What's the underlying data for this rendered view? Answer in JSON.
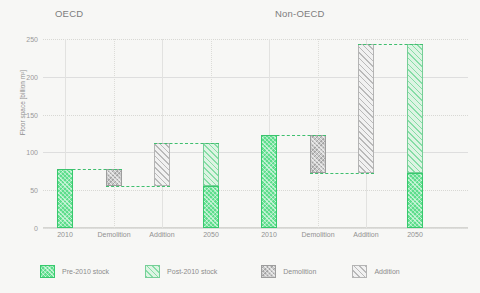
{
  "panels": {
    "left_title": "OECD",
    "right_title": "Non-OECD"
  },
  "axis": {
    "ylabel": "Floor space [billion m²]",
    "yticks": [
      "250",
      "200",
      "150",
      "100",
      "50",
      "0"
    ],
    "xticks_oecd": [
      "2010",
      "Demolition",
      "Addition",
      "2050"
    ],
    "xticks_nonoecd": [
      "2010",
      "Demolition",
      "Addition",
      "2050"
    ]
  },
  "legend": [
    {
      "label": "Pre-2010 stock",
      "color": "#5ddd8c",
      "style": "pre"
    },
    {
      "label": "Post-2010 stock",
      "color": "#ddf4e3",
      "style": "post"
    },
    {
      "label": "Demolition",
      "color": "#c9c9c9",
      "style": "demo"
    },
    {
      "label": "Addition",
      "color": "#f1f1f1",
      "style": "add"
    }
  ],
  "chart_data": {
    "type": "bar",
    "subtype": "waterfall",
    "title": "",
    "xlabel": "",
    "ylabel": "Floor space [billion m²]",
    "ylim": [
      0,
      250
    ],
    "ytick_values": [
      0,
      50,
      100,
      150,
      200,
      250
    ],
    "grid": true,
    "legend_position": "bottom",
    "panels": [
      {
        "name": "OECD",
        "categories": [
          "2010",
          "Demolition",
          "Addition",
          "2050"
        ],
        "bars": [
          {
            "category": "2010",
            "type": "total",
            "base": 0,
            "top": 78,
            "value": 78,
            "segments": [
              {
                "style": "pre",
                "from": 0,
                "to": 78
              }
            ]
          },
          {
            "category": "Demolition",
            "type": "decrease",
            "base": 56,
            "top": 78,
            "value": -22,
            "segments": [
              {
                "style": "demo",
                "from": 56,
                "to": 78
              }
            ]
          },
          {
            "category": "Addition",
            "type": "increase",
            "base": 56,
            "top": 113,
            "value": 57,
            "segments": [
              {
                "style": "add",
                "from": 56,
                "to": 113
              }
            ]
          },
          {
            "category": "2050",
            "type": "total",
            "base": 0,
            "top": 113,
            "value": 113,
            "segments": [
              {
                "style": "pre",
                "from": 0,
                "to": 56
              },
              {
                "style": "post",
                "from": 56,
                "to": 113
              }
            ]
          }
        ]
      },
      {
        "name": "Non-OECD",
        "categories": [
          "2010",
          "Demolition",
          "Addition",
          "2050"
        ],
        "bars": [
          {
            "category": "2010",
            "type": "total",
            "base": 0,
            "top": 123,
            "value": 123,
            "segments": [
              {
                "style": "pre",
                "from": 0,
                "to": 123
              }
            ]
          },
          {
            "category": "Demolition",
            "type": "decrease",
            "base": 73,
            "top": 123,
            "value": -50,
            "segments": [
              {
                "style": "demo",
                "from": 73,
                "to": 123
              }
            ]
          },
          {
            "category": "Addition",
            "type": "increase",
            "base": 73,
            "top": 243,
            "value": 170,
            "segments": [
              {
                "style": "add",
                "from": 73,
                "to": 243
              }
            ]
          },
          {
            "category": "2050",
            "type": "total",
            "base": 0,
            "top": 243,
            "value": 243,
            "segments": [
              {
                "style": "pre",
                "from": 0,
                "to": 73
              },
              {
                "style": "post",
                "from": 73,
                "to": 243
              }
            ]
          }
        ]
      }
    ],
    "connectors": [
      {
        "panel": "OECD",
        "from_category": "2010",
        "to_category": "Demolition",
        "level": 78
      },
      {
        "panel": "OECD",
        "from_category": "Demolition",
        "to_category": "Addition",
        "level": 56
      },
      {
        "panel": "OECD",
        "from_category": "Addition",
        "to_category": "2050",
        "level": 113
      },
      {
        "panel": "Non-OECD",
        "from_category": "2010",
        "to_category": "Demolition",
        "level": 123
      },
      {
        "panel": "Non-OECD",
        "from_category": "Demolition",
        "to_category": "Addition",
        "level": 73
      },
      {
        "panel": "Non-OECD",
        "from_category": "Addition",
        "to_category": "2050",
        "level": 243
      }
    ]
  }
}
